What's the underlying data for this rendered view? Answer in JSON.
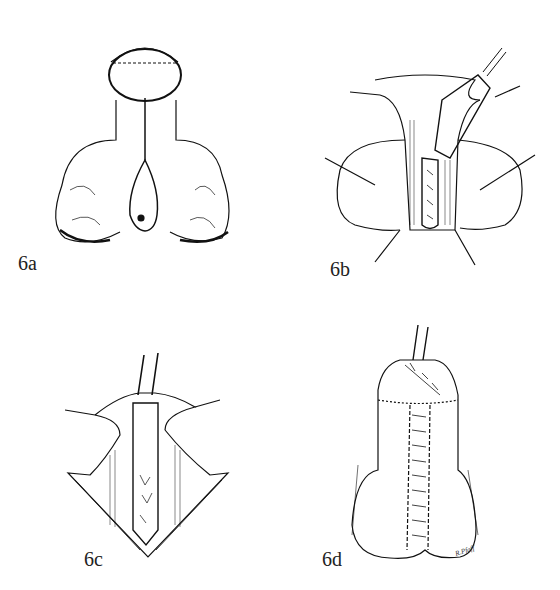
{
  "figure": {
    "panels": [
      {
        "id": "6a",
        "label": "6a"
      },
      {
        "id": "6b",
        "label": "6b"
      },
      {
        "id": "6c",
        "label": "6c"
      },
      {
        "id": "6d",
        "label": "6d"
      }
    ],
    "signature": "R.Pfaff"
  }
}
